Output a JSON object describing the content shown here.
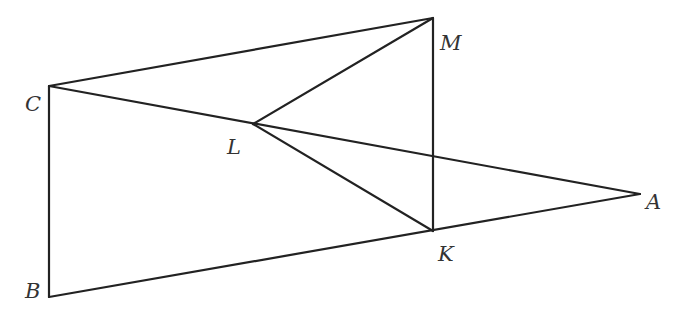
{
  "diagram": {
    "type": "geometry",
    "points": {
      "A": {
        "x": 640,
        "y": 194,
        "label": "A",
        "lx": 646,
        "ly": 209
      },
      "B": {
        "x": 49,
        "y": 297,
        "label": "B",
        "lx": 25,
        "ly": 298
      },
      "C": {
        "x": 49,
        "y": 86,
        "label": "C",
        "lx": 25,
        "ly": 111
      },
      "K": {
        "x": 433,
        "y": 231,
        "label": "K",
        "lx": 438,
        "ly": 261
      },
      "L": {
        "x": 253,
        "y": 124,
        "label": "L",
        "lx": 227,
        "ly": 154
      },
      "M": {
        "x": 433,
        "y": 18,
        "label": "M",
        "lx": 440,
        "ly": 50
      }
    },
    "segments": [
      [
        "C",
        "M"
      ],
      [
        "C",
        "B"
      ],
      [
        "C",
        "A"
      ],
      [
        "L",
        "M"
      ],
      [
        "L",
        "K"
      ],
      [
        "M",
        "K"
      ],
      [
        "B",
        "A"
      ]
    ],
    "colors": {
      "line": "#222222",
      "label": "#333333",
      "background": "#ffffff"
    }
  }
}
